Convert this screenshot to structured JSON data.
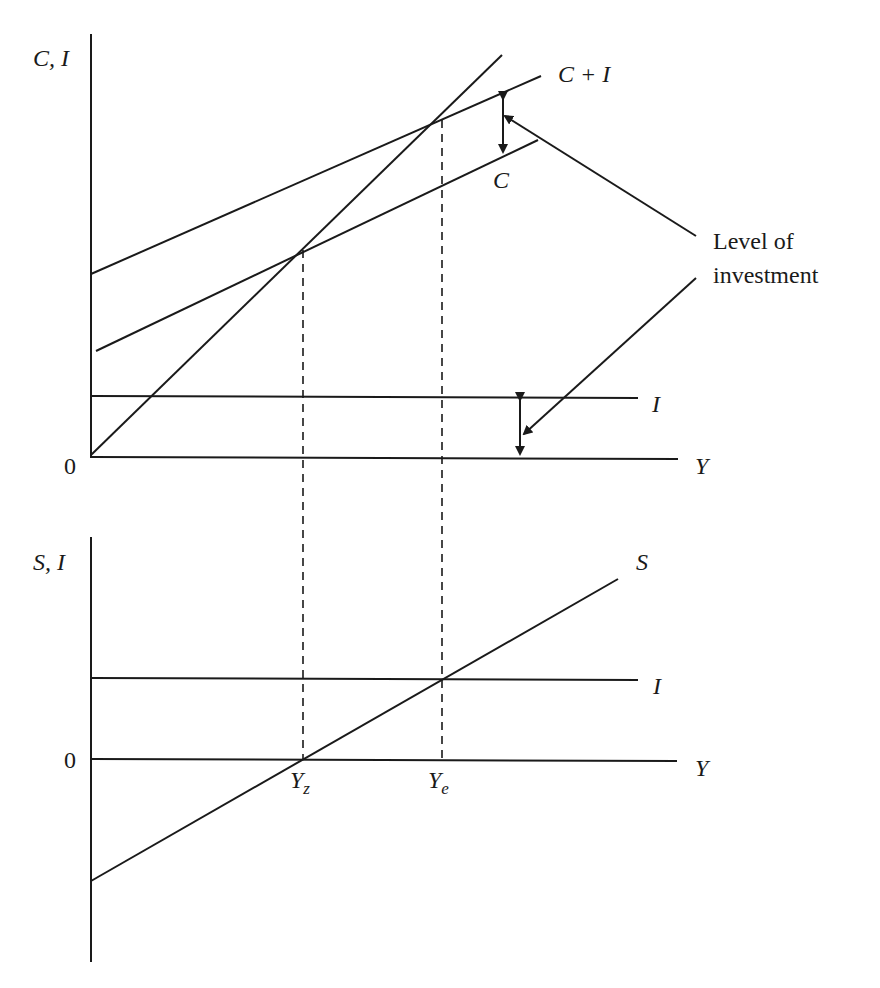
{
  "diagram": {
    "top_panel": {
      "y_axis_label": "C, I",
      "origin_label": "0",
      "x_axis_label": "Y",
      "curves": {
        "c_plus_i": "C + I",
        "c": "C",
        "i": "I"
      }
    },
    "bottom_panel": {
      "y_axis_label": "S, I",
      "origin_label": "0",
      "x_axis_label": "Y",
      "curves": {
        "s": "S",
        "i": "I"
      },
      "ticks": {
        "yz": "Y",
        "yz_sub": "z",
        "ye": "Y",
        "ye_sub": "e"
      }
    },
    "annotation": {
      "line1": "Level of",
      "line2": "investment"
    },
    "colors": {
      "ink": "#1a1a1a",
      "background": "#ffffff"
    }
  }
}
